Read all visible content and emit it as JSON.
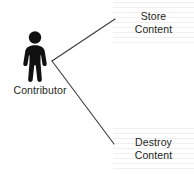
{
  "diagram": {
    "type": "actor-use-case-sketch",
    "width": 194,
    "height": 174,
    "background_color": "#ffffff",
    "line_color": "#3a3a3a",
    "text_color": "#231f20",
    "rule_color": "#f0f0f0",
    "actor": {
      "icon": "person-pictogram-icon",
      "label": "Contributor",
      "fill_color": "#111111"
    },
    "branches": [
      {
        "id": "store-content",
        "line_1": "Store",
        "line_2": "Content",
        "from": {
          "x": 52,
          "y": 61
        },
        "to": {
          "x": 115,
          "y": 19
        }
      },
      {
        "id": "destroy-content",
        "line_1": "Destroy",
        "line_2": "Content",
        "from": {
          "x": 52,
          "y": 61
        },
        "to": {
          "x": 114,
          "y": 144
        }
      }
    ]
  }
}
